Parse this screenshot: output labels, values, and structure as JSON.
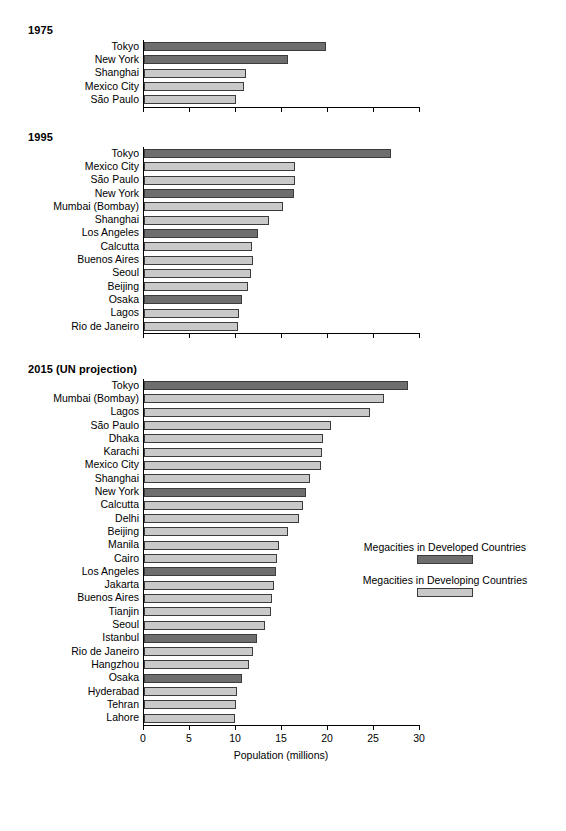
{
  "chart_data": {
    "type": "bar",
    "orientation": "horizontal",
    "title": "",
    "xlabel": "Population (millions)",
    "ylabel": "",
    "xlim": [
      0,
      30
    ],
    "xticks": [
      0,
      5,
      10,
      15,
      20,
      25,
      30
    ],
    "xticklabels": [
      "0",
      "5",
      "10",
      "15",
      "20",
      "25",
      "30"
    ],
    "grid": false,
    "legend_position": "right-middle",
    "legend": [
      {
        "label": "Megacities in Developed Countries",
        "key": "developed",
        "color": "#6e6e6e"
      },
      {
        "label": "Megacities in Developing Countries",
        "key": "developing",
        "color": "#c9c9c9"
      }
    ],
    "panels": [
      {
        "title": "1975",
        "categories": [
          "Tokyo",
          "New York",
          "Shanghai",
          "Mexico City",
          "São Paulo"
        ],
        "values": [
          19.8,
          15.6,
          11.1,
          10.9,
          10.0
        ],
        "groups": [
          "developed",
          "developed",
          "developing",
          "developing",
          "developing"
        ]
      },
      {
        "title": "1995",
        "categories": [
          "Tokyo",
          "Mexico City",
          "São Paulo",
          "New York",
          "Mumbai (Bombay)",
          "Shanghai",
          "Los Angeles",
          "Calcutta",
          "Buenos Aires",
          "Seoul",
          "Beijing",
          "Osaka",
          "Lagos",
          "Rio de Janeiro"
        ],
        "values": [
          26.8,
          16.4,
          16.4,
          16.3,
          15.1,
          13.6,
          12.4,
          11.7,
          11.8,
          11.6,
          11.3,
          10.6,
          10.3,
          10.2
        ],
        "groups": [
          "developed",
          "developing",
          "developing",
          "developed",
          "developing",
          "developing",
          "developed",
          "developing",
          "developing",
          "developing",
          "developing",
          "developed",
          "developing",
          "developing"
        ]
      },
      {
        "title": "2015 (UN projection)",
        "categories": [
          "Tokyo",
          "Mumbai (Bombay)",
          "Lagos",
          "São Paulo",
          "Dhaka",
          "Karachi",
          "Mexico City",
          "Shanghai",
          "New York",
          "Calcutta",
          "Delhi",
          "Beijing",
          "Manila",
          "Cairo",
          "Los Angeles",
          "Jakarta",
          "Buenos Aires",
          "Tianjin",
          "Seoul",
          "Istanbul",
          "Rio de Janeiro",
          "Hangzhou",
          "Osaka",
          "Hyderabad",
          "Tehran",
          "Lahore"
        ],
        "values": [
          28.7,
          26.1,
          24.6,
          20.3,
          19.5,
          19.4,
          19.2,
          18.0,
          17.6,
          17.3,
          16.9,
          15.6,
          14.7,
          14.5,
          14.3,
          14.1,
          13.9,
          13.8,
          13.1,
          12.3,
          11.9,
          11.4,
          10.6,
          10.1,
          10.0,
          9.9
        ],
        "groups": [
          "developed",
          "developing",
          "developing",
          "developing",
          "developing",
          "developing",
          "developing",
          "developing",
          "developed",
          "developing",
          "developing",
          "developing",
          "developing",
          "developing",
          "developed",
          "developing",
          "developing",
          "developing",
          "developing",
          "developed",
          "developing",
          "developing",
          "developed",
          "developing",
          "developing",
          "developing"
        ]
      }
    ]
  }
}
